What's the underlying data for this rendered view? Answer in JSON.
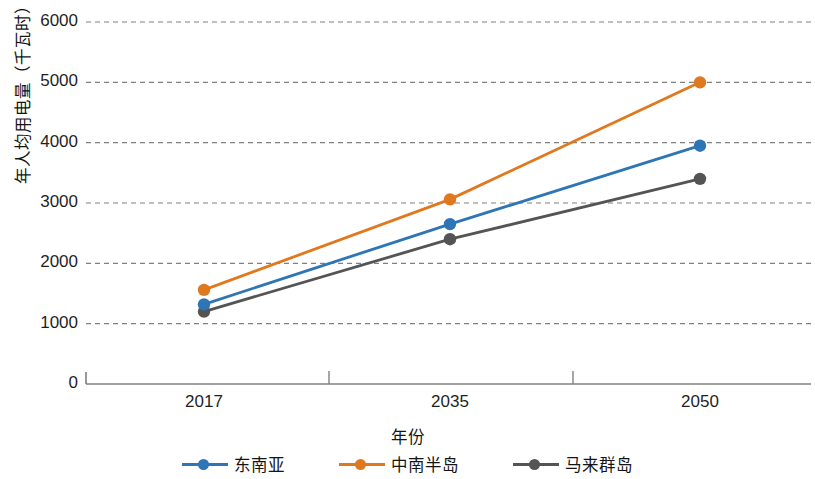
{
  "chart_data": {
    "type": "line",
    "title": "",
    "xlabel": "年份",
    "ylabel": "年人均用电量（千瓦时）",
    "categories": [
      "2017",
      "2035",
      "2050"
    ],
    "series": [
      {
        "name": "东南亚",
        "color": "#2E75B6",
        "values": [
          1320,
          2650,
          3950
        ]
      },
      {
        "name": "中南半岛",
        "color": "#E0781E",
        "values": [
          1560,
          3060,
          5000
        ]
      },
      {
        "name": "马来群岛",
        "color": "#545454",
        "values": [
          1200,
          2400,
          3400
        ]
      }
    ],
    "ylim": [
      0,
      6000
    ],
    "yticks": [
      0,
      1000,
      2000,
      3000,
      4000,
      5000,
      6000
    ],
    "ytick_labels": [
      "0",
      "1000",
      "2000",
      "3000",
      "4000",
      "5000",
      "6000"
    ],
    "grid": true,
    "grid_style": "dashed",
    "grid_color": "#808080",
    "legend_position": "bottom",
    "axis_color": "#808080",
    "marker": "circle"
  }
}
